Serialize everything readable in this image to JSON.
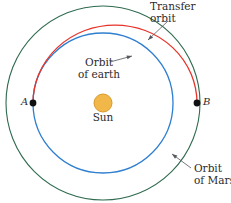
{
  "figure": {
    "width": 231,
    "height": 203,
    "background": "#ffffff"
  },
  "labels": {
    "transfer_orbit_line1": "Transfer",
    "transfer_orbit_line2": "orbit",
    "orbit_of_earth_line1": "Orbit",
    "orbit_of_earth_line2": "of earth",
    "sun": "Sun",
    "orbit_of_mars_line1": "Orbit",
    "orbit_of_mars_line2": "of Mars",
    "point_a": "A",
    "point_b": "B"
  },
  "colors": {
    "mars_orbit": "#2e6b4f",
    "earth_orbit": "#2f7fd0",
    "transfer_orbit": "#e8332a",
    "sun_fill": "#f2b749",
    "sun_stroke": "#d99a2b",
    "marker": "#111111",
    "leader_line": "#55585c",
    "text": "#2b2b2b"
  },
  "geometry": {
    "sun_center_x": 103,
    "sun_center_y": 103,
    "sun_radius": 9,
    "mars_orbit_radius": 97,
    "earth_orbit_radius": 70,
    "transfer_semi_major": 82,
    "transfer_semi_minor": 78,
    "point_a_x": 33,
    "point_a_y": 103,
    "point_b_x": 197,
    "point_b_y": 103,
    "marker_radius": 3.4
  },
  "leaders": [
    {
      "name": "transfer-orbit-leader",
      "x1": 168,
      "y1": 21,
      "x2": 148,
      "y2": 40
    },
    {
      "name": "orbit-of-earth-leader",
      "x1": 110,
      "y1": 62,
      "x2": 132,
      "y2": 56
    },
    {
      "name": "orbit-of-mars-leader",
      "x1": 191,
      "y1": 168,
      "x2": 172,
      "y2": 154
    }
  ]
}
